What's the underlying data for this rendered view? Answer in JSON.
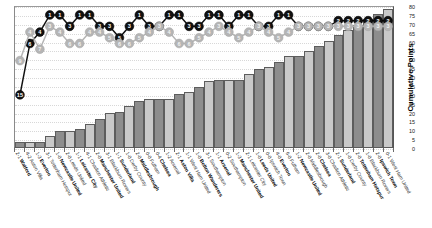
{
  "chart_data": {
    "type": "bar",
    "title": "",
    "xlabel": "",
    "ylabel": "Cumulative Points",
    "ylim": [
      0,
      80
    ],
    "ytick_step": 5,
    "yticks": [
      0,
      5,
      10,
      15,
      20,
      25,
      30,
      35,
      40,
      45,
      50,
      55,
      60,
      65,
      70,
      75,
      80
    ],
    "grid": true,
    "legend_position": "none",
    "colors": {
      "bar_home": "#8d8d8d",
      "bar_away": "#c9c9c9",
      "bar_mid": "#9c9c9c",
      "bar_edge": "#5d5d5d",
      "line_primary": "#111111",
      "line_secondary": "#b5b5b5",
      "grid": "#d8d8d8",
      "axis": "#5a5a5a",
      "text": "#111111"
    },
    "categories": [
      "Watford",
      "Aston Villa",
      "Everton",
      "Tottenham Hotspur",
      "Newcastle United",
      "Leeds United",
      "Leicester City",
      "Charlton Athletic",
      "Manchester United",
      "Blackburn Rovers",
      "Sunderland",
      "Derby County",
      "Middlesbrough",
      "Fulham",
      "Chelsea",
      "Arsenal",
      "Aston Villa",
      "West Ham United",
      "Bolton Wanderers",
      "Southampton",
      "Arsenal",
      "Southampton",
      "Manchester United",
      "Leicester City",
      "Leeds United",
      "Ipswich Town",
      "Everton",
      "Fulham",
      "Newcastle United",
      "Middlesbrough",
      "Chelsea",
      "Charlton Athletic",
      "Sunderland",
      "Derby County",
      "Tottenham Hotspur",
      "Blackburn Rovers",
      "Ipswich Town",
      "West Ham United"
    ],
    "scores": [
      "2-1",
      "4-2",
      "1-3",
      "3-1",
      "1-0",
      "2-0",
      "1-1",
      "4-1",
      "2-0",
      "3-1",
      "1-1",
      "1-0",
      "2-0",
      "0-0",
      "0-4",
      "1-2",
      "2-1",
      "1-1",
      "1-0",
      "3-1",
      "1-1",
      "0-2",
      "1-3",
      "2-1",
      "1-0",
      "0-0",
      "4-0",
      "6-0",
      "1-2",
      "2-0",
      "2-0",
      "3-0",
      "2-1",
      "1-0",
      "2-0",
      "1-0",
      "2-0",
      "0-1"
    ],
    "venues": [
      "home",
      "away",
      "home",
      "away",
      "home",
      "away",
      "home",
      "away",
      "home",
      "away",
      "home",
      "away",
      "home",
      "away",
      "home",
      "away",
      "home",
      "away",
      "home",
      "away",
      "home",
      "away",
      "home",
      "away",
      "home",
      "away",
      "home",
      "away",
      "home",
      "away",
      "home",
      "away",
      "home",
      "away",
      "home",
      "away",
      "home",
      "away"
    ],
    "series": [
      {
        "name": "Cumulative Points",
        "type": "bar",
        "axis": "right",
        "values": [
          3,
          3,
          3,
          6,
          9,
          9,
          10,
          13,
          16,
          19,
          20,
          23,
          26,
          27,
          27,
          27,
          30,
          31,
          34,
          37,
          38,
          38,
          38,
          41,
          44,
          45,
          48,
          51,
          51,
          54,
          57,
          60,
          63,
          66,
          69,
          72,
          75,
          78
        ]
      },
      {
        "name": "League Position",
        "type": "line",
        "marker": "numbered-circle",
        "color": "#111111",
        "values": [
          15,
          6,
          4,
          1,
          1,
          3,
          1,
          1,
          3,
          3,
          5,
          3,
          1,
          3,
          3,
          1,
          1,
          3,
          3,
          1,
          1,
          3,
          1,
          1,
          3,
          3,
          1,
          1,
          3,
          3,
          3,
          3,
          2,
          2,
          2,
          2,
          2,
          2
        ]
      },
      {
        "name": "Opponent Position",
        "type": "line",
        "marker": "numbered-circle",
        "color": "#b5b5b5",
        "values": [
          9,
          4,
          7,
          3,
          4,
          6,
          6,
          4,
          4,
          5,
          6,
          6,
          5,
          4,
          3,
          4,
          6,
          6,
          5,
          4,
          3,
          4,
          5,
          4,
          3,
          4,
          5,
          4,
          3,
          3,
          3,
          3,
          3,
          3,
          3,
          3,
          3,
          3
        ]
      }
    ]
  }
}
